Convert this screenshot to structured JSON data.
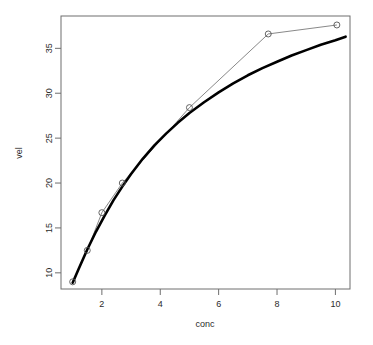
{
  "chart_data": {
    "type": "scatter",
    "title": "",
    "subtitle": "",
    "xlabel": "conc",
    "ylabel": "vel",
    "xlim": [
      0.6,
      10.5
    ],
    "ylim": [
      8.2,
      38.6
    ],
    "xticks": [
      2,
      4,
      6,
      8,
      10
    ],
    "yticks": [
      10,
      15,
      20,
      25,
      30,
      35
    ],
    "xtick_labels": [
      "2",
      "4",
      "6",
      "8",
      "10"
    ],
    "ytick_labels": [
      "10",
      "15",
      "20",
      "25",
      "30",
      "35"
    ],
    "grid": false,
    "legend": null,
    "legend_position": "none",
    "box": true,
    "series": [
      {
        "name": "observed",
        "type": "scatter-line",
        "marker": "open-circle",
        "marker_size": 3,
        "color": "#555555",
        "line_width": 0.7,
        "x": [
          1.0,
          1.5,
          2.0,
          2.7,
          5.0,
          7.7,
          10.05
        ],
        "y": [
          9.0,
          12.5,
          16.7,
          20.0,
          28.4,
          36.6,
          37.6
        ]
      },
      {
        "name": "fitted",
        "type": "line",
        "marker": "none",
        "color": "#000000",
        "line_width": 2.6,
        "x": [
          1.0,
          1.2,
          1.5,
          1.8,
          2.1,
          2.4,
          2.7,
          3.0,
          3.4,
          3.8,
          4.2,
          4.6,
          5.0,
          5.5,
          6.0,
          6.5,
          7.0,
          7.5,
          8.0,
          8.5,
          9.0,
          9.5,
          10.0,
          10.35
        ],
        "y": [
          8.9,
          10.4,
          12.6,
          14.6,
          16.4,
          18.1,
          19.6,
          21.0,
          22.7,
          24.2,
          25.5,
          26.7,
          27.8,
          29.0,
          30.1,
          31.1,
          32.0,
          32.8,
          33.5,
          34.2,
          34.8,
          35.4,
          35.9,
          36.3
        ]
      }
    ],
    "annotations": []
  },
  "labels": {
    "x_axis_title": "conc",
    "y_axis_title": "vel"
  },
  "colors": {
    "background": "#ffffff",
    "axis": "#6e6e6e",
    "fitted_curve": "#000000",
    "observed_line": "#555555",
    "tick_label": "#2b2b2b"
  }
}
